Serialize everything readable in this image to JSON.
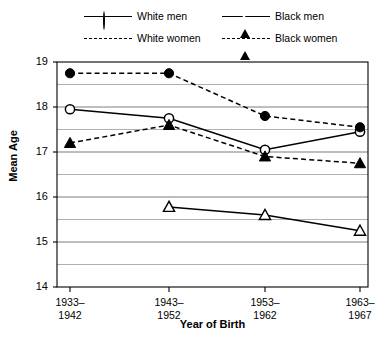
{
  "legend": {
    "entries": [
      {
        "label": "White men",
        "marker": "open-circle",
        "line": "solid"
      },
      {
        "label": "White women",
        "marker": "filled-circle",
        "line": "dashed"
      },
      {
        "label": "Black men",
        "marker": "open-triangle",
        "line": "solid"
      },
      {
        "label": "Black women",
        "marker": "filled-triangle",
        "line": "dashed"
      }
    ]
  },
  "axes": {
    "ylabel": "Mean Age",
    "xlabel": "Year of Birth",
    "yticks": [
      "19",
      "18",
      "17",
      "16",
      "15",
      "14"
    ],
    "xticks": [
      {
        "line1": "1933–",
        "line2": "1942"
      },
      {
        "line1": "1943–",
        "line2": "1952"
      },
      {
        "line1": "1953–",
        "line2": "1962"
      },
      {
        "line1": "1963–",
        "line2": "1967"
      }
    ]
  },
  "chart_data": {
    "type": "line",
    "title": "",
    "xlabel": "Year of Birth",
    "ylabel": "Mean Age",
    "categories": [
      "1933-1942",
      "1943-1952",
      "1953-1962",
      "1963-1967"
    ],
    "ylim": [
      14,
      19
    ],
    "ytick_values": [
      14,
      15,
      16,
      17,
      18,
      19
    ],
    "minor_gridlines": [
      14.5,
      15.5,
      16.5,
      17.5,
      18.5
    ],
    "grid": true,
    "legend_position": "above-plot",
    "series": [
      {
        "name": "White men",
        "marker": "open-circle",
        "linestyle": "solid",
        "color": "#000000",
        "values": [
          17.95,
          17.75,
          17.05,
          17.45
        ]
      },
      {
        "name": "White women",
        "marker": "filled-circle",
        "linestyle": "dashed",
        "color": "#000000",
        "values": [
          18.75,
          18.75,
          17.8,
          17.55
        ]
      },
      {
        "name": "Black men",
        "marker": "open-triangle",
        "linestyle": "solid",
        "color": "#000000",
        "values": [
          null,
          15.78,
          15.6,
          15.25
        ]
      },
      {
        "name": "Black women",
        "marker": "filled-triangle",
        "linestyle": "dashed",
        "color": "#000000",
        "values": [
          17.2,
          17.6,
          16.9,
          16.75
        ]
      }
    ]
  }
}
